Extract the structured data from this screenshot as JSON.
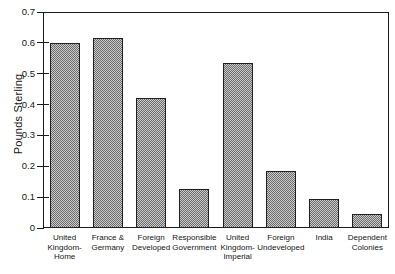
{
  "chart_data": {
    "type": "bar",
    "title": "",
    "subtitle": "",
    "xlabel": "",
    "ylabel": "Pounds Sterling",
    "categories": [
      "United Kingdom-Home",
      "France & Germany",
      "Foreign Developed",
      "Responsible Government",
      "United Kingdom-Imperial",
      "Foreign Undeveloped",
      "India",
      "Dependent Colonies"
    ],
    "category_lines": [
      [
        "United",
        "Kingdom-",
        "Home"
      ],
      [
        "France &",
        "Germany"
      ],
      [
        "Foreign",
        "Developed"
      ],
      [
        "Responsible",
        "Government"
      ],
      [
        "United",
        "Kingdom-",
        "Imperial"
      ],
      [
        "Foreign",
        "Undeveloped"
      ],
      [
        "India"
      ],
      [
        "Dependent",
        "Colonies"
      ]
    ],
    "values": [
      0.6,
      0.615,
      0.42,
      0.125,
      0.535,
      0.185,
      0.095,
      0.045
    ],
    "ylim": [
      0,
      0.7
    ],
    "ytick_labels": [
      "0",
      "0.1",
      "0.2",
      "0.3",
      "0.4",
      "0.5",
      "0.6",
      "0.7"
    ],
    "ytick_values": [
      0,
      0.1,
      0.2,
      0.3,
      0.4,
      0.5,
      0.6,
      0.7
    ],
    "grid": false,
    "legend": "none",
    "bar_fill_color": "#9a9a9a",
    "bar_edge_color": "#1f1f1f",
    "axis_color": "#1a1a1a",
    "background_color": "#ffffff"
  }
}
